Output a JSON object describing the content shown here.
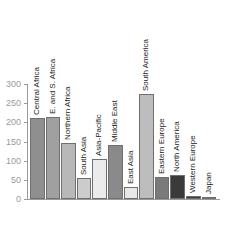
{
  "chart_data": {
    "type": "bar",
    "title": "",
    "xlabel": "",
    "ylabel": "",
    "ylim": [
      0,
      300
    ],
    "yticks": [
      0,
      50,
      100,
      150,
      200,
      250,
      300
    ],
    "grid": false,
    "legend": null,
    "categories": [
      "Central Africa",
      "E. and S. Africa",
      "Northern Africa",
      "South Asia",
      "Asia-Pacific",
      "Middle East",
      "East Asia",
      "South America",
      "Eastern Europe",
      "North America",
      "Western Europe",
      "Japan"
    ],
    "values": [
      211,
      213,
      146,
      55,
      104,
      141,
      31,
      273,
      57,
      62,
      8,
      4
    ],
    "colors": [
      "#8f8f8f",
      "#a0a0a0",
      "#b8b8b8",
      "#cccccc",
      "#ebebeb",
      "#8a8a8a",
      "#e8e8e8",
      "#bdbdbd",
      "#7a7a7a",
      "#3a3a3a",
      "#3c3c3c",
      "#888888"
    ]
  }
}
